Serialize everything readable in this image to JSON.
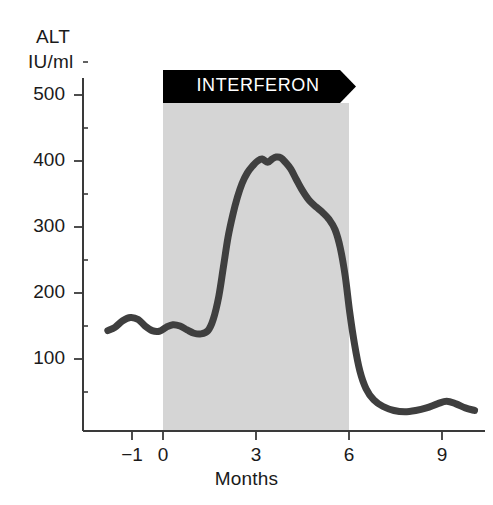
{
  "chart_data": {
    "type": "line",
    "title": "",
    "subtitle": "",
    "ylabel_line1": "ALT",
    "ylabel_line2": "IU/ml",
    "xlabel": "Months",
    "xlim": [
      -1.8,
      10.2
    ],
    "ylim": [
      0,
      540
    ],
    "grid": false,
    "legend": null,
    "yticks_major": [
      100,
      200,
      300,
      400,
      500
    ],
    "yticks_major_labels": [
      "100",
      "200",
      "300",
      "400",
      "500"
    ],
    "yticks_minor": [
      50,
      150,
      250,
      350,
      450,
      550
    ],
    "xticks_major": [
      -1,
      0,
      3,
      6,
      9
    ],
    "xticks_major_labels": [
      "−1",
      "0",
      "3",
      "6",
      "9"
    ],
    "annotations": [
      {
        "name": "treatment-band",
        "label": "INTERFERON",
        "shape": "arrow-banner",
        "x_start": 0,
        "x_end": 6,
        "shade_color": "#d5d5d5",
        "banner_color": "#000000",
        "banner_text_color": "#ffffff"
      }
    ],
    "series": [
      {
        "name": "ALT",
        "color": "#3f3f3f",
        "line_width": 7,
        "x": [
          -1.78,
          -1.55,
          -1.3,
          -1.05,
          -0.8,
          -0.58,
          -0.35,
          -0.12,
          0.1,
          0.32,
          0.55,
          0.78,
          1.0,
          1.22,
          1.45,
          1.62,
          1.8,
          1.95,
          2.1,
          2.25,
          2.4,
          2.55,
          2.72,
          2.9,
          3.05,
          3.2,
          3.38,
          3.52,
          3.65,
          3.8,
          3.95,
          4.12,
          4.3,
          4.5,
          4.72,
          4.95,
          5.15,
          5.35,
          5.55,
          5.72,
          5.88,
          6.02,
          6.18,
          6.35,
          6.55,
          6.8,
          7.1,
          7.45,
          7.8,
          8.15,
          8.5,
          8.85,
          9.15,
          9.45,
          9.75,
          10.05
        ],
        "y": [
          143,
          148,
          158,
          163,
          160,
          150,
          143,
          142,
          148,
          152,
          150,
          144,
          139,
          138,
          143,
          160,
          195,
          240,
          285,
          318,
          345,
          366,
          382,
          393,
          400,
          403,
          398,
          403,
          406,
          405,
          398,
          388,
          372,
          355,
          340,
          330,
          322,
          312,
          296,
          268,
          225,
          172,
          122,
          82,
          55,
          38,
          28,
          22,
          20,
          22,
          26,
          32,
          36,
          32,
          26,
          22
        ]
      }
    ]
  },
  "axes": {
    "axis_color": "#3a3a3a",
    "tick_color": "#3a3a3a",
    "background": "#ffffff"
  }
}
